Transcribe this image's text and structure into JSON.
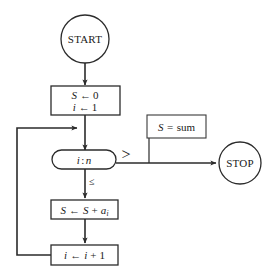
{
  "diagram": {
    "background_color": "#ffffff",
    "line_color": "#2b2b2b",
    "text_color": "#1a1a1a"
  },
  "nodes": {
    "start": {
      "label": "START",
      "shape": "circle"
    },
    "init": {
      "line1": "S ← 0",
      "line1_var": "S",
      "line1_arrow": "←",
      "line1_value": "0",
      "line2_var": "i",
      "line2_arrow": "←",
      "line2_value": "1",
      "shape": "rectangle"
    },
    "decision": {
      "label": "i : n",
      "left_operand": "i",
      "separator": ":",
      "right_operand": "n",
      "shape": "stadium"
    },
    "accumulate": {
      "var": "S",
      "arrow": "←",
      "expr_a": "S",
      "plus": "+",
      "expr_b": "a",
      "subscript": "i",
      "shape": "rectangle"
    },
    "increment": {
      "var": "i",
      "arrow": "←",
      "expr_a": "i",
      "plus": "+",
      "expr_b": "1",
      "shape": "rectangle"
    },
    "annotation": {
      "var": "S",
      "equals": "=",
      "value": "sum",
      "shape": "rectangle"
    },
    "stop": {
      "label": "STOP",
      "shape": "circle"
    }
  },
  "branches": {
    "greater": "＞",
    "less_equal": "≤"
  }
}
